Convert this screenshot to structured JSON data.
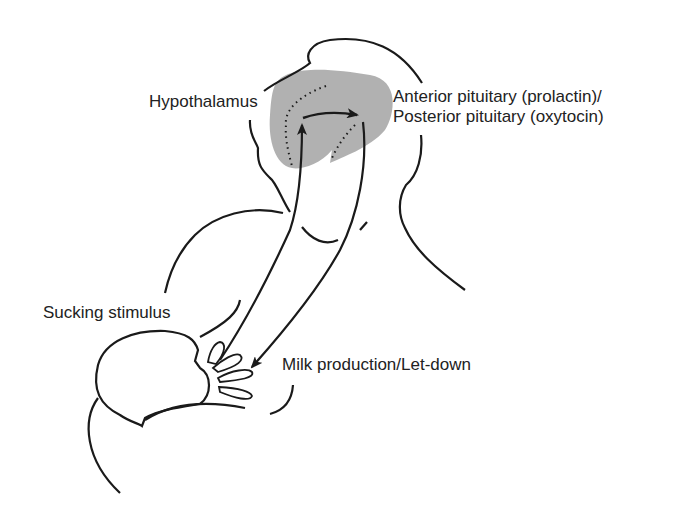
{
  "diagram": {
    "type": "physiology-illustration",
    "labels": {
      "hypothalamus": "Hypothalamus",
      "pituitary_line1": "Anterior pituitary (prolactin)/",
      "pituitary_line2": "Posterior pituitary (oxytocin)",
      "sucking": "Sucking stimulus",
      "milk": "Milk production/Let-down"
    },
    "colors": {
      "stroke": "#1a1a1a",
      "brain_shade": "#a8a8a8",
      "background": "#ffffff"
    },
    "flow": [
      {
        "from": "Sucking stimulus",
        "to": "Hypothalamus"
      },
      {
        "from": "Hypothalamus",
        "to": "Anterior/Posterior pituitary"
      },
      {
        "from": "Anterior/Posterior pituitary",
        "to": "Milk production/Let-down"
      }
    ]
  }
}
